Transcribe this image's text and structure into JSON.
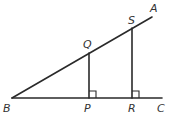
{
  "diagram": {
    "type": "geometry",
    "points": {
      "A": {
        "label": "A",
        "x": 153,
        "y": 15
      },
      "B": {
        "label": "B",
        "x": 12,
        "y": 98
      },
      "C": {
        "label": "C",
        "x": 162,
        "y": 98
      },
      "Q": {
        "label": "Q",
        "x": 89,
        "y": 53
      },
      "P": {
        "label": "P",
        "x": 89,
        "y": 98
      },
      "S": {
        "label": "S",
        "x": 132,
        "y": 28
      },
      "R": {
        "label": "R",
        "x": 132,
        "y": 98
      }
    },
    "segments": [
      "BA",
      "BC",
      "QP",
      "SR"
    ],
    "right_angles": [
      "QPC",
      "SRC"
    ],
    "labels": {
      "A": "A",
      "B": "B",
      "C": "C",
      "P": "P",
      "Q": "Q",
      "R": "R",
      "S": "S"
    },
    "colors": {
      "line": "#2a2a2a",
      "text": "#333333",
      "background": "#ffffff"
    }
  }
}
